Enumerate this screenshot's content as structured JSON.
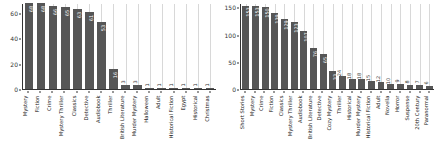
{
  "chart_data": [
    {
      "type": "bar",
      "panel": "left",
      "title": "",
      "xlabel": "",
      "ylabel": "",
      "ylim": [
        0,
        68
      ],
      "yticks": [
        0,
        20,
        40,
        60
      ],
      "grid": true,
      "grid_axis": "x",
      "bar_color": "#565656",
      "categories": [
        "Mystery",
        "Fiction",
        "Crime",
        "Mystery Thriller",
        "Classics",
        "Detective",
        "Audiobook",
        "Thriller",
        "British Literature",
        "Murder Mystery",
        "Halloween",
        "Adult",
        "Historical Fiction",
        "Egypt",
        "Historical",
        "Christmas"
      ],
      "values": [
        68,
        68,
        66,
        65,
        63,
        61,
        53,
        16,
        3,
        3,
        1,
        1,
        1,
        1,
        1,
        1
      ],
      "labels": [
        "68",
        "68",
        "66",
        "65",
        "63",
        "61",
        "53",
        "16",
        "3",
        "3",
        "1",
        "1",
        "1",
        "1",
        "1",
        "1"
      ]
    },
    {
      "type": "bar",
      "panel": "right",
      "title": "",
      "xlabel": "",
      "ylabel": "",
      "ylim": [
        0,
        158
      ],
      "yticks": [
        0,
        50,
        100,
        150
      ],
      "grid": true,
      "grid_axis": "x",
      "bar_color": "#565656",
      "categories": [
        "Short Stories",
        "Mystery",
        "Crime",
        "Fiction",
        "Classics",
        "Mystery Thriller",
        "Audiobook",
        "British Literature",
        "Detective",
        "Cozy Mystery",
        "Thriller",
        "Historical",
        "Murder Mystery",
        "Historical Fiction",
        "Adult",
        "Novella",
        "Horror",
        "Suspense",
        "20th Century",
        "Paranormal"
      ],
      "values": [
        153,
        153,
        150,
        139,
        129,
        123,
        107,
        76,
        65,
        33,
        24,
        18,
        18,
        15,
        12,
        10,
        9,
        8,
        7,
        6
      ],
      "labels": [
        "153",
        "153",
        "150",
        "139",
        "129",
        "123",
        "107",
        "76",
        "65",
        "33",
        "24",
        "18",
        "18",
        "15",
        "12",
        "10",
        "9",
        "8",
        "7",
        "6"
      ]
    }
  ]
}
